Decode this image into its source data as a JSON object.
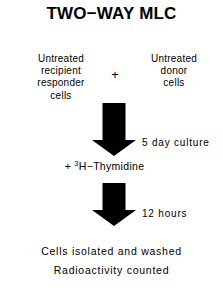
{
  "title": "TWO−WAY MLC",
  "inputs": {
    "left": {
      "lines": [
        "Untreated",
        "recipient",
        "responder",
        "cells"
      ]
    },
    "operator": "+",
    "right": {
      "lines": [
        "Untreated",
        "donor",
        "cells"
      ]
    }
  },
  "steps": [
    {
      "arrow": "down-block-arrow",
      "label": "5 day culture"
    },
    {
      "arrow": "down-block-arrow",
      "label": "12 hours"
    }
  ],
  "reagent": {
    "prefix": "+ ",
    "superscript": "3",
    "name": "H−Thymidine"
  },
  "results": [
    "Cells isolated and washed",
    "Radioactivity counted"
  ],
  "colors": {
    "ink": "#000000",
    "background": "#ffffff"
  }
}
